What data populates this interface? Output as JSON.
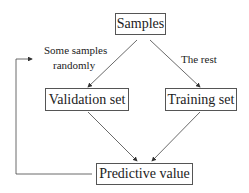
{
  "diagram": {
    "nodes": {
      "samples": "Samples",
      "validation": "Validation set",
      "training": "Training set",
      "predictive": "Predictive value"
    },
    "edge_labels": {
      "left_line1": "Some samples",
      "left_line2": "randomly",
      "right": "The rest"
    }
  }
}
